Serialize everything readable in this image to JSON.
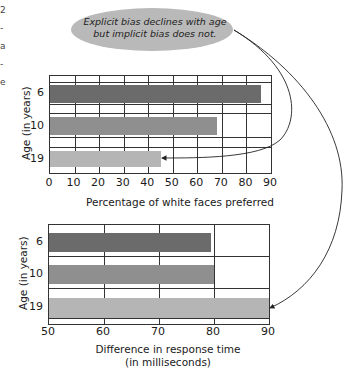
{
  "callout": {
    "line1": "Explicit bias declines with age",
    "line2": "but implicit bias does not."
  },
  "colors": {
    "age6": "#6b6b6b",
    "age10": "#8f8f8f",
    "age19": "#b5b5b5",
    "callout_fill": "#b9b9b9"
  },
  "chart_data": [
    {
      "type": "bar",
      "orientation": "horizontal",
      "title": "",
      "categories": [
        "6",
        "10",
        "19"
      ],
      "values": [
        86,
        68,
        45
      ],
      "xlabel": "Percentage of white faces preferred",
      "ylabel": "Age (in years)",
      "xlim": [
        0,
        90
      ],
      "xticks": [
        "0",
        "10",
        "20",
        "30",
        "40",
        "50",
        "60",
        "70",
        "80",
        "90"
      ],
      "grid": true,
      "legend": null
    },
    {
      "type": "bar",
      "orientation": "horizontal",
      "title": "",
      "categories": [
        "6",
        "10",
        "19"
      ],
      "values": [
        79.5,
        80,
        90
      ],
      "xlabel": "Difference in response time (in milliseconds)",
      "xlabel_line1": "Difference in response time",
      "xlabel_line2": "(in milliseconds)",
      "ylabel": "Age (in years)",
      "xlim": [
        50,
        90
      ],
      "xticks": [
        "50",
        "60",
        "70",
        "80",
        "90"
      ],
      "grid": true,
      "legend": null
    }
  ],
  "annotations": [
    {
      "text": "Explicit bias declines with age but implicit bias does not.",
      "arrows_to": [
        "top chart, age 19 bar",
        "bottom chart, age 19 bar"
      ]
    }
  ],
  "edge_fragments": [
    "2",
    "-",
    "a",
    "-",
    "e",
    "-",
    "-",
    "-",
    "-",
    "-"
  ]
}
